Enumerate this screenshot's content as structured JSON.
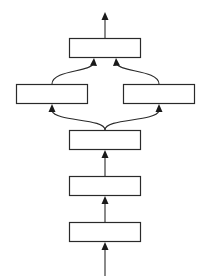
{
  "diagram": {
    "type": "flow",
    "direction": "bottom-to-top",
    "colors": {
      "stroke": "#2a2a2a",
      "box_fill": "#ffffff",
      "background": "#ffffff"
    },
    "nodes": [
      {
        "id": "n1",
        "label": "",
        "position": "bottom"
      },
      {
        "id": "n2",
        "label": "",
        "position": "lower-middle"
      },
      {
        "id": "n3",
        "label": "",
        "position": "middle"
      },
      {
        "id": "n4",
        "label": "",
        "position": "left-branch"
      },
      {
        "id": "n5",
        "label": "",
        "position": "right-branch"
      },
      {
        "id": "n6",
        "label": "",
        "position": "top"
      }
    ],
    "edges": [
      {
        "from": "input",
        "to": "n1"
      },
      {
        "from": "n1",
        "to": "n2"
      },
      {
        "from": "n2",
        "to": "n3"
      },
      {
        "from": "n3",
        "to": "n4"
      },
      {
        "from": "n3",
        "to": "n5"
      },
      {
        "from": "n4",
        "to": "n6"
      },
      {
        "from": "n5",
        "to": "n6"
      },
      {
        "from": "n6",
        "to": "output"
      }
    ]
  }
}
